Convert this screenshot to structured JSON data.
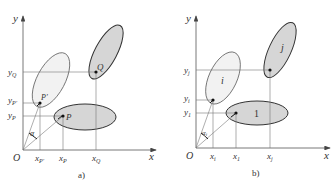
{
  "colors": {
    "axis": "#555555",
    "guide": "#777777",
    "ellipse_light_fill": "#f1f1f1",
    "ellipse_dark_fill": "#d6d6d6",
    "stroke": "#444444",
    "point": "#111111"
  },
  "panel_a": {
    "caption": "a)",
    "axis_x": "x",
    "axis_y": "y",
    "origin": "O",
    "angle": "α",
    "points": {
      "P": "P",
      "P_prime": "P′",
      "Q": "Q"
    },
    "x_ticks": {
      "xPp": "x",
      "xPp_sub": "P′",
      "xP": "x",
      "xP_sub": "P",
      "xQ": "x",
      "xQ_sub": "Q"
    },
    "y_ticks": {
      "yQ": "y",
      "yQ_sub": "Q",
      "yPp": "y",
      "yPp_sub": "P′",
      "yP": "y",
      "yP_sub": "P"
    }
  },
  "panel_b": {
    "caption": "b)",
    "axis_x": "x",
    "axis_y": "y",
    "origin": "O",
    "angle": "α",
    "angle_sub": "i",
    "regions": {
      "i": "i",
      "j": "j",
      "one": "1"
    },
    "x_ticks": {
      "xi": "x",
      "xi_sub": "i",
      "x1": "x",
      "x1_sub": "1",
      "xj": "x",
      "xj_sub": "j"
    },
    "y_ticks": {
      "yj": "y",
      "yj_sub": "j",
      "yi": "y",
      "yi_sub": "i",
      "y1": "y",
      "y1_sub": "1"
    }
  }
}
